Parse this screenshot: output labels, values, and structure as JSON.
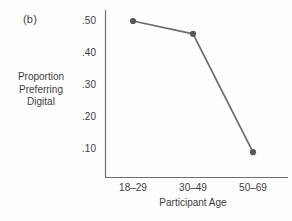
{
  "figure": {
    "panel_label": "(b)"
  },
  "chart_data": {
    "type": "line",
    "title": "",
    "categories": [
      "18–29",
      "30–49",
      "50–69"
    ],
    "series": [
      {
        "name": "Proportion preferring digital",
        "values": [
          0.5,
          0.46,
          0.09
        ]
      }
    ],
    "xlabel": "Participant Age",
    "ylabel": "Proportion Preferring Digital",
    "ylabel_lines": [
      "Proportion",
      "Preferring",
      "Digital"
    ],
    "ytick_labels": [
      ".50",
      ".40",
      ".30",
      ".20",
      ".10"
    ],
    "ylim": [
      0,
      0.55
    ],
    "grid": false,
    "legend": "none",
    "colors": {
      "line": "#6b6b6b",
      "marker": "#585858",
      "axis": "#6e6e6e",
      "text": "#3c3c3c"
    }
  }
}
